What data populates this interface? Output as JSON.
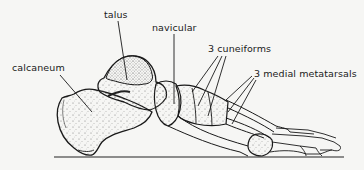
{
  "figure": {
    "labels": {
      "talus": "talus",
      "navicular": "navicular",
      "cuneiforms": "3 cuneiforms",
      "metatarsals": "3 medial metatarsals",
      "calcaneum": "calcaneum"
    },
    "colors": {
      "ink": "#1a1a1a",
      "paper": "#f6f6f4",
      "stipple": "#555555"
    }
  }
}
